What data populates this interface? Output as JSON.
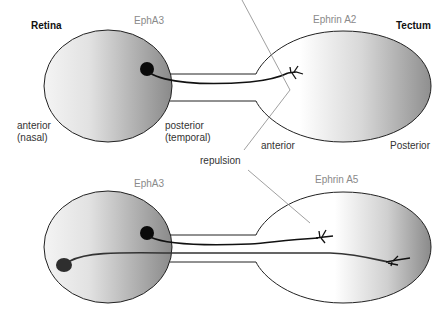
{
  "diagram": {
    "title_left": "Retina",
    "title_right": "Tectum",
    "top_panel": {
      "receptor_label": "EphA3",
      "ligand_label": "Ephrin A2",
      "retina_anterior": "anterior",
      "retina_anterior_sub": "(nasal)",
      "retina_posterior": "posterior",
      "retina_posterior_sub": "(temporal)",
      "tectum_anterior": "anterior",
      "tectum_posterior": "Posterior"
    },
    "middle": {
      "repulsion_label": "repulsion"
    },
    "bottom_panel": {
      "receptor_label": "EphA3",
      "ligand_label": "Ephrin A5"
    },
    "colors": {
      "outline": "#222222",
      "gradient_light": "#ffffff",
      "gradient_dark": "#8c8c8c",
      "neuron": "#111111",
      "neuron_nasal": "#333333",
      "leader_line": "#888888"
    }
  }
}
